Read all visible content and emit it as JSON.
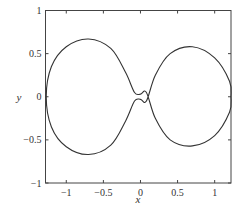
{
  "chart_data": {
    "type": "line",
    "title": "",
    "xlabel": "x",
    "ylabel": "y",
    "xlim": [
      -1.28,
      1.22
    ],
    "ylim": [
      -1,
      1
    ],
    "xticks": [
      "-1",
      "-0.5",
      "0",
      "0.5",
      "1"
    ],
    "yticks": [
      "1",
      "0.5",
      "0",
      "-0.5",
      "-1"
    ],
    "grid": false,
    "series": [
      {
        "name": "closed curve",
        "description": "figure-eight shaped closed curve with small loop at origin",
        "points": [
          [
            -1.27,
            0
          ],
          [
            -1.2,
            0.35
          ],
          [
            -1.0,
            0.58
          ],
          [
            -0.7,
            0.67
          ],
          [
            -0.4,
            0.56
          ],
          [
            -0.2,
            0.28
          ],
          [
            -0.08,
            0.05
          ],
          [
            0.0,
            0.03
          ],
          [
            0.08,
            0.05
          ],
          [
            0.2,
            -0.25
          ],
          [
            0.4,
            -0.5
          ],
          [
            0.7,
            -0.57
          ],
          [
            1.0,
            -0.45
          ],
          [
            1.2,
            -0.18
          ],
          [
            1.22,
            0
          ],
          [
            1.2,
            0.18
          ],
          [
            1.0,
            0.45
          ],
          [
            0.7,
            0.58
          ],
          [
            0.4,
            0.5
          ],
          [
            0.2,
            0.25
          ],
          [
            0.08,
            -0.05
          ],
          [
            0.0,
            -0.03
          ],
          [
            -0.08,
            -0.05
          ],
          [
            -0.2,
            -0.28
          ],
          [
            -0.4,
            -0.56
          ],
          [
            -0.7,
            -0.67
          ],
          [
            -1.0,
            -0.58
          ],
          [
            -1.2,
            -0.35
          ],
          [
            -1.27,
            0
          ]
        ]
      }
    ]
  }
}
